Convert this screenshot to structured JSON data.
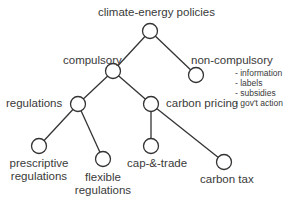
{
  "diagram": {
    "title": "climate-energy policies",
    "colors": {
      "stroke": "#333333",
      "node_fill": "#ffffff",
      "text": "#3a3a3a"
    },
    "nodes": {
      "root": {
        "label": "climate-energy policies"
      },
      "compulsory": {
        "label": "compulsory"
      },
      "non_compulsory": {
        "label": "non-compulsory",
        "notes": [
          "- information",
          "- labels",
          "- subsidies",
          "- gov't action"
        ]
      },
      "regulations": {
        "label": "regulations"
      },
      "carbon_pricing": {
        "label": "carbon pricing"
      },
      "prescriptive": {
        "line1": "prescriptive",
        "line2": "regulations"
      },
      "flexible": {
        "line1": "flexible",
        "line2": "regulations"
      },
      "cap_trade": {
        "label": "cap-&-trade"
      },
      "carbon_tax": {
        "label": "carbon tax"
      }
    },
    "edges": [
      [
        "climate-energy policies",
        "compulsory"
      ],
      [
        "climate-energy policies",
        "non-compulsory"
      ],
      [
        "compulsory",
        "regulations"
      ],
      [
        "compulsory",
        "carbon pricing"
      ],
      [
        "regulations",
        "prescriptive regulations"
      ],
      [
        "regulations",
        "flexible regulations"
      ],
      [
        "carbon pricing",
        "cap-&-trade"
      ],
      [
        "carbon pricing",
        "carbon tax"
      ]
    ]
  }
}
